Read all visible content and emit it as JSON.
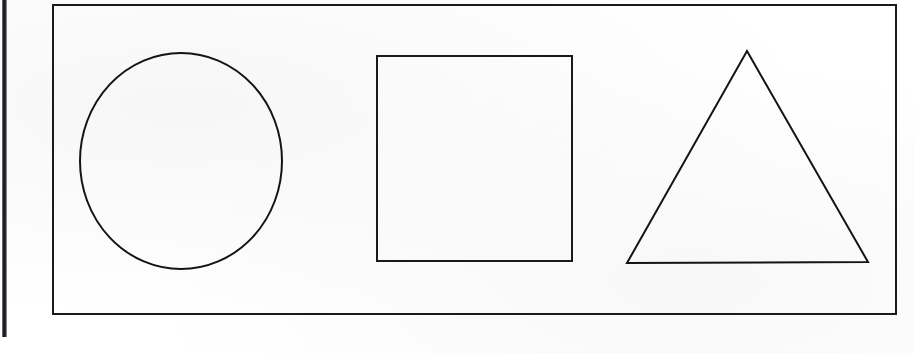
{
  "document": {
    "kind": "scanned-worksheet",
    "description": "Three outlined geometric shapes inside a rectangular border",
    "background_color": "#ffffff",
    "ink_color": "#141414"
  },
  "artifacts": {
    "binding_bar": {
      "name": "scan-edge-bar",
      "color": "#1b1b1f",
      "x": 2,
      "y": 0,
      "width": 5,
      "height": 337
    }
  },
  "frame": {
    "name": "outer-border",
    "x": 52,
    "y": 4,
    "width": 845,
    "height": 311,
    "stroke_width": 2,
    "stroke_color": "#1a1a1a"
  },
  "shapes": [
    {
      "id": "circle",
      "label": "Circle",
      "type": "ellipse",
      "cx": 181,
      "cy": 161,
      "rx": 101,
      "ry": 108,
      "stroke_width": 2,
      "stroke_color": "#141414",
      "fill": "none"
    },
    {
      "id": "square",
      "label": "Square",
      "type": "rectangle",
      "x": 376,
      "y": 55,
      "width": 197,
      "height": 207,
      "stroke_width": 2,
      "stroke_color": "#1a1a1a",
      "fill": "none"
    },
    {
      "id": "triangle",
      "label": "Triangle",
      "type": "polygon",
      "points": "747,51 868,262 627,263",
      "apex": {
        "x": 747,
        "y": 51
      },
      "bottom_left": {
        "x": 627,
        "y": 263
      },
      "bottom_right": {
        "x": 868,
        "y": 262
      },
      "stroke_width": 2,
      "stroke_color": "#141414",
      "fill": "none"
    }
  ]
}
